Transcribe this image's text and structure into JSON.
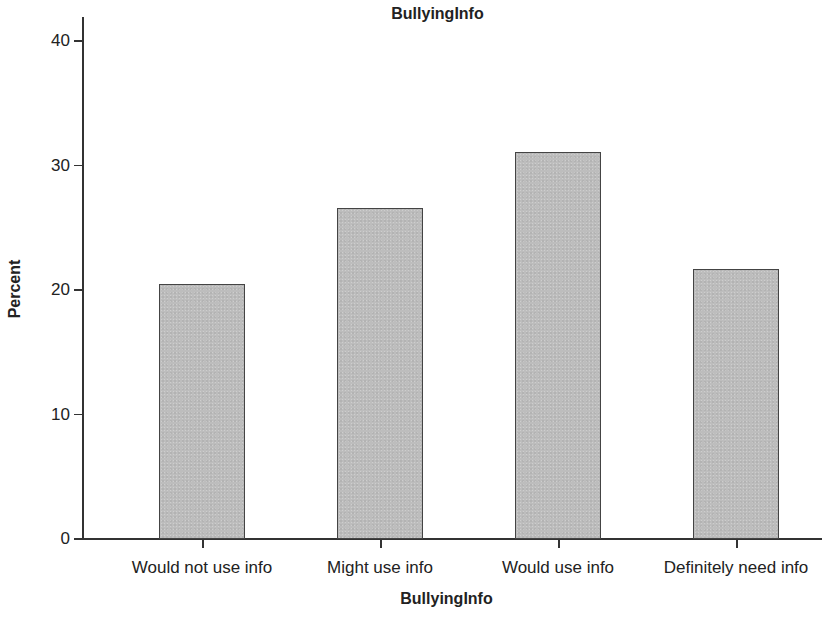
{
  "chart_data": {
    "type": "bar",
    "title": "BullyingInfo",
    "xlabel": "BullyingInfo",
    "ylabel": "Percent",
    "categories": [
      "Would not use info",
      "Might use info",
      "Would use info",
      "Definitely need info"
    ],
    "values": [
      20.4,
      26.5,
      31.0,
      21.6
    ],
    "ylim": [
      0,
      42
    ],
    "yticks": [
      0,
      10,
      20,
      30,
      40
    ],
    "ytick_labels": [
      "0",
      "10",
      "20",
      "30",
      "40"
    ],
    "grid": false,
    "legend": null,
    "bar_color": "#bdbdbd",
    "bar_edge_color": "#444444"
  }
}
